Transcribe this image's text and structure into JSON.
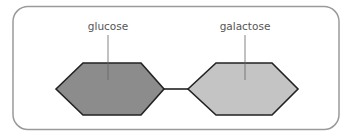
{
  "diagram": {
    "frame": {
      "stroke": "#9a9a9a",
      "fill": "#ffffff"
    },
    "units": [
      {
        "label": "glucose",
        "fill": "#8c8c8c",
        "stroke": "#222222",
        "points": "56,89 83,63 141,63 164,89 141,115 83,115",
        "label_x": 108,
        "label_y": 30,
        "leader": {
          "x": 108,
          "y1": 35,
          "y2": 80
        }
      },
      {
        "label": "galactose",
        "fill": "#c4c4c4",
        "stroke": "#222222",
        "points": "188,89 216,63 272,63 298,89 272,115 216,115",
        "label_x": 245,
        "label_y": 30,
        "leader": {
          "x": 245,
          "y1": 35,
          "y2": 80
        }
      }
    ],
    "bond": {
      "x1": 164,
      "y1": 89,
      "x2": 188,
      "y2": 89,
      "stroke": "#222222"
    }
  }
}
